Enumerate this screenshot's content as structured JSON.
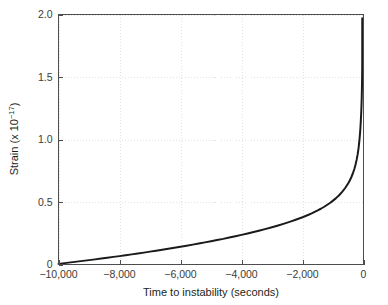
{
  "figure": {
    "background_color": "#ffffff",
    "frame_color": "#4d4d4d",
    "grid_color": "#d9d9d9",
    "curve_color": "#1a1a1a"
  },
  "chart_data": {
    "type": "line",
    "title": "",
    "xlabel": "Time to instability (seconds)",
    "ylabel_main": "Strain (x 10",
    "ylabel_exponent": "−17",
    "ylabel_close": ")",
    "ylabel_full": "Strain (x 10⁻¹⁷)",
    "xlim": [
      -10000,
      0
    ],
    "ylim": [
      0,
      2.0
    ],
    "grid": true,
    "legend": "none",
    "xticks": [
      -10000,
      -8000,
      -6000,
      -4000,
      -2000,
      0
    ],
    "xtick_labels": [
      "−10,000",
      "−8,000",
      "−6,000",
      "−4,000",
      "−2,000",
      "0"
    ],
    "yticks": [
      0,
      0.5,
      1.0,
      1.5,
      2.0
    ],
    "ytick_labels": [
      "0",
      "0.5",
      "1.0",
      "1.5",
      "2.0"
    ],
    "series": [
      {
        "name": "strain",
        "x": [
          -10000,
          -9800,
          -9600,
          -9400,
          -9200,
          -9000,
          -8800,
          -8600,
          -8400,
          -8200,
          -8000,
          -7800,
          -7600,
          -7400,
          -7200,
          -7000,
          -6800,
          -6600,
          -6400,
          -6200,
          -6000,
          -5800,
          -5600,
          -5400,
          -5200,
          -5000,
          -4800,
          -4600,
          -4400,
          -4200,
          -4000,
          -3800,
          -3600,
          -3400,
          -3200,
          -3000,
          -2800,
          -2600,
          -2400,
          -2200,
          -2000,
          -1900,
          -1800,
          -1700,
          -1600,
          -1500,
          -1400,
          -1300,
          -1200,
          -1100,
          -1000,
          -900,
          -800,
          -700,
          -600,
          -500,
          -450,
          -400,
          -350,
          -300,
          -260,
          -220,
          -190,
          -160,
          -135,
          -115,
          -100,
          -88,
          -78,
          -70,
          -63,
          -57,
          -52,
          -48,
          -45,
          -43,
          -41.5,
          -40.5,
          -40
        ],
        "y": [
          0.005,
          0.011,
          0.017,
          0.023,
          0.029,
          0.035,
          0.041,
          0.048,
          0.054,
          0.061,
          0.067,
          0.074,
          0.081,
          0.088,
          0.095,
          0.103,
          0.11,
          0.118,
          0.126,
          0.134,
          0.142,
          0.15,
          0.159,
          0.168,
          0.177,
          0.186,
          0.196,
          0.205,
          0.216,
          0.226,
          0.237,
          0.248,
          0.26,
          0.272,
          0.285,
          0.298,
          0.312,
          0.327,
          0.343,
          0.36,
          0.378,
          0.388,
          0.398,
          0.409,
          0.421,
          0.433,
          0.446,
          0.46,
          0.476,
          0.492,
          0.511,
          0.531,
          0.554,
          0.581,
          0.612,
          0.65,
          0.672,
          0.698,
          0.728,
          0.764,
          0.8,
          0.843,
          0.883,
          0.935,
          0.991,
          1.046,
          1.096,
          1.148,
          1.197,
          1.243,
          1.292,
          1.345,
          1.396,
          1.451,
          1.5,
          1.54,
          1.58,
          1.64,
          1.97
        ]
      }
    ],
    "annotations": [
      {
        "text": "curve diverges asymptotically as time approaches 0",
        "kind": "trend"
      }
    ]
  }
}
